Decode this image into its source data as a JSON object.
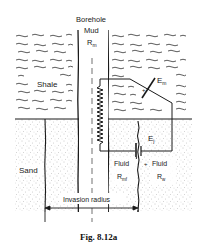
{
  "figure": {
    "caption": "Fig. 8.12a"
  },
  "labels": {
    "borehole_line1": "Borehole",
    "borehole_line2": "Mud",
    "borehole_resistivity": "R",
    "borehole_resistivity_sub": "m",
    "shale": "Shale",
    "sand": "Sand",
    "em": "E",
    "em_sub": "m",
    "ej": "E",
    "ej_sub": "j",
    "fluid_filtrate": "Fluid",
    "fluid_filtrate_res": "R",
    "fluid_filtrate_res_sub": "mf",
    "fluid_formation": "Fluid",
    "fluid_formation_res": "R",
    "fluid_formation_res_sub": "w",
    "invasion_radius": "Invasion radius"
  },
  "colors": {
    "line": "#1a1a1a",
    "sand_dots": "#8a8a8a",
    "background": "#ffffff"
  }
}
